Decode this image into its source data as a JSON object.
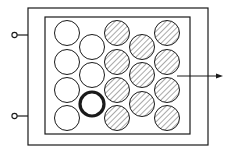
{
  "diagram": {
    "colors": {
      "stroke": "#1a1a1a",
      "background": "#ffffff",
      "hatch": "#555555"
    },
    "outer_frame": {
      "x": 28,
      "y": 8,
      "w": 180,
      "h": 137
    },
    "inner_frame": {
      "x": 45,
      "y": 17,
      "w": 145,
      "h": 117
    },
    "pins": [
      {
        "y": 35
      },
      {
        "y": 116
      }
    ],
    "circle_radius": 12.5,
    "circles": [
      {
        "cx": 67,
        "cy": 33,
        "type": "empty"
      },
      {
        "cx": 67,
        "cy": 62,
        "type": "empty"
      },
      {
        "cx": 67,
        "cy": 90,
        "type": "empty"
      },
      {
        "cx": 67,
        "cy": 118,
        "type": "empty"
      },
      {
        "cx": 92,
        "cy": 47,
        "type": "empty"
      },
      {
        "cx": 92,
        "cy": 75,
        "type": "empty"
      },
      {
        "cx": 92,
        "cy": 104,
        "type": "bold"
      },
      {
        "cx": 117,
        "cy": 33,
        "type": "hatched"
      },
      {
        "cx": 117,
        "cy": 62,
        "type": "hatched"
      },
      {
        "cx": 117,
        "cy": 90,
        "type": "hatched"
      },
      {
        "cx": 117,
        "cy": 118,
        "type": "hatched"
      },
      {
        "cx": 142,
        "cy": 47,
        "type": "hatched"
      },
      {
        "cx": 142,
        "cy": 75,
        "type": "hatched"
      },
      {
        "cx": 142,
        "cy": 104,
        "type": "hatched"
      },
      {
        "cx": 167,
        "cy": 33,
        "type": "hatched"
      },
      {
        "cx": 167,
        "cy": 62,
        "type": "hatched"
      },
      {
        "cx": 167,
        "cy": 90,
        "type": "hatched"
      },
      {
        "cx": 167,
        "cy": 118,
        "type": "hatched"
      }
    ],
    "arrow": {
      "x1": 177,
      "y1": 76,
      "x2": 223,
      "y2": 76
    }
  }
}
